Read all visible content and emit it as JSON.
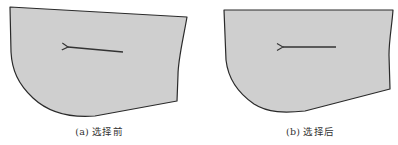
{
  "figure": {
    "panels": [
      {
        "id": "a",
        "caption": "(a) 选择前",
        "fill_color": "#cfcfcf",
        "stroke_color": "#2a2a2a",
        "arrow_direction": "left"
      },
      {
        "id": "b",
        "caption": "(b) 选择后",
        "fill_color": "#cfcfcf",
        "stroke_color": "#2a2a2a",
        "arrow_direction": "left"
      }
    ]
  }
}
